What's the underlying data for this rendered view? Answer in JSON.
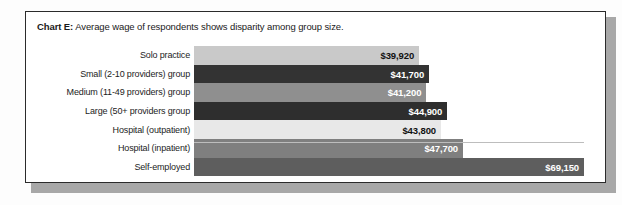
{
  "figure": {
    "title_lead": "Chart E:",
    "title_rest": " Average wage of respondents shows disparity among group size."
  },
  "chart_data": {
    "type": "bar",
    "orientation": "horizontal",
    "title": "Chart E: Average wage of respondents shows disparity among group size.",
    "xlabel": "",
    "ylabel": "",
    "grid": false,
    "legend": "none",
    "xlim": [
      0,
      69150
    ],
    "categories": [
      "Solo practice",
      "Small (2-10 providers) group",
      "Medium (11-49 providers) group",
      "Large (50+ providers group",
      "Hospital (outpatient)",
      "Hospital (inpatient)",
      "Self-employed"
    ],
    "values": [
      39920,
      41700,
      41200,
      44900,
      43800,
      47700,
      69150
    ],
    "value_labels": [
      "$39,920",
      "$41,700",
      "$41,200",
      "$44,900",
      "$43,800",
      "$47,700",
      "$69,150"
    ],
    "bar_colors": [
      "#c9c9c9",
      "#333333",
      "#8f8f8f",
      "#2e2e2e",
      "#e8e8e8",
      "#7f7f7f",
      "#5e5e5e"
    ],
    "label_text_colors": [
      "#111111",
      "#ffffff",
      "#ffffff",
      "#ffffff",
      "#111111",
      "#ffffff",
      "#ffffff"
    ]
  }
}
